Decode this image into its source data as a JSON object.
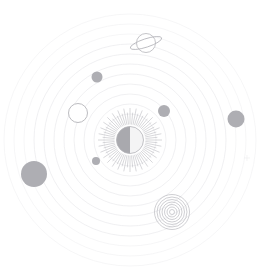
{
  "scene": {
    "title": "Cosmic Orbit Illustration",
    "width": 267,
    "height": 276,
    "background_color": "#ffffff",
    "center_x": 130,
    "center_y": 140
  },
  "palette": {
    "background": "#ffffff",
    "orbit_ring": "#e9e9ec",
    "orbit_ring_faint": "#f0f0f2",
    "sun_ray": "#b8b8bd",
    "sun_core_dark": "#a9a9ae",
    "sun_core_light": "#f4f4f5",
    "planet_fill": "#a3a3a8",
    "planet_fill_soft": "#aeaeb3",
    "outline_stroke": "#b4b4b9",
    "micro_star": "#ececef"
  },
  "sun": {
    "label": "sun-with-rays",
    "cx": 130,
    "cy": 140,
    "core_radius": 13.5,
    "ray_count": 64,
    "ray_inner_radius": 15.5,
    "ray_outer_radius": 32,
    "phase": "half-lit",
    "dark_side": "left",
    "light_side": "right"
  },
  "orbits": [
    {
      "label": "orbit-1",
      "cx": 130,
      "cy": 140,
      "rx": 26,
      "ry": 26,
      "faint": false
    },
    {
      "label": "orbit-2",
      "cx": 130,
      "cy": 140,
      "rx": 36,
      "ry": 36,
      "faint": false
    },
    {
      "label": "orbit-3",
      "cx": 130,
      "cy": 140,
      "rx": 46,
      "ry": 46,
      "faint": false
    },
    {
      "label": "orbit-4",
      "cx": 130,
      "cy": 140,
      "rx": 56,
      "ry": 56,
      "faint": false
    },
    {
      "label": "orbit-5",
      "cx": 130,
      "cy": 140,
      "rx": 66,
      "ry": 66,
      "faint": false
    },
    {
      "label": "orbit-6",
      "cx": 130,
      "cy": 140,
      "rx": 76,
      "ry": 76,
      "faint": false
    },
    {
      "label": "orbit-7",
      "cx": 130,
      "cy": 140,
      "rx": 86,
      "ry": 86,
      "faint": false
    },
    {
      "label": "orbit-8",
      "cx": 130,
      "cy": 140,
      "rx": 96,
      "ry": 96,
      "faint": false
    },
    {
      "label": "orbit-9",
      "cx": 130,
      "cy": 140,
      "rx": 106,
      "ry": 106,
      "faint": true
    },
    {
      "label": "orbit-10",
      "cx": 130,
      "cy": 140,
      "rx": 116,
      "ry": 116,
      "faint": true
    },
    {
      "label": "orbit-11",
      "cx": 130,
      "cy": 140,
      "rx": 126,
      "ry": 126,
      "faint": true
    }
  ],
  "planets": [
    {
      "label": "planet-large-left",
      "type": "filled",
      "cx": 34,
      "cy": 174,
      "r": 13.0,
      "tone": "soft"
    },
    {
      "label": "planet-right-edge",
      "type": "filled",
      "cx": 236,
      "cy": 119,
      "r": 8.5,
      "tone": "soft"
    },
    {
      "label": "planet-upper-left",
      "type": "filled",
      "cx": 97,
      "cy": 77,
      "r": 5.5,
      "tone": "soft"
    },
    {
      "label": "planet-inner-right",
      "type": "filled",
      "cx": 164,
      "cy": 111,
      "r": 6.0,
      "tone": "soft"
    },
    {
      "label": "planet-inner-small",
      "type": "filled",
      "cx": 96,
      "cy": 161,
      "r": 4.0,
      "tone": "soft"
    },
    {
      "label": "planet-hollow-ring",
      "type": "outline",
      "cx": 78,
      "cy": 113,
      "r": 9.5,
      "tone": "outline"
    }
  ],
  "saturn": {
    "label": "saturn-planet",
    "cx": 146,
    "cy": 43,
    "body_radius": 9.5,
    "ring_rx": 16.5,
    "ring_ry": 4.2,
    "ring_rotation_deg": -18
  },
  "spiral": {
    "label": "concentric-spiral-galaxy",
    "cx": 172,
    "cy": 212,
    "radii": [
      2.5,
      5.0,
      7.5,
      10.0,
      12.5,
      15.0,
      17.5
    ]
  },
  "micro_stars": [
    {
      "label": "micro-star-right",
      "cx": 247,
      "cy": 158,
      "size": 3.0
    }
  ]
}
